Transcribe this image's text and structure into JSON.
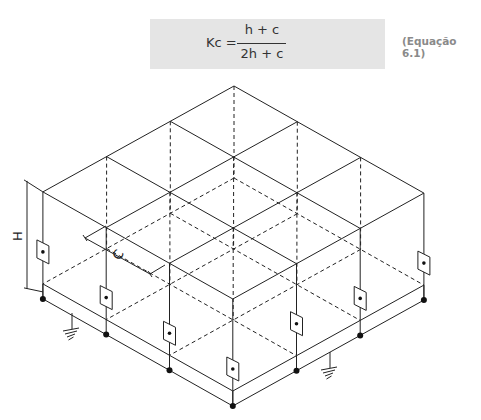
{
  "equation": {
    "lhs": "Kc =",
    "numerator": "h + c",
    "denominator": "2h + c",
    "label": "(Equação 6.1)",
    "box_color": "#e5e5e5"
  },
  "diagram": {
    "grid_cells": 3,
    "dimension_labels": {
      "height": "H",
      "cell": "C"
    },
    "line_color": "#222222"
  }
}
